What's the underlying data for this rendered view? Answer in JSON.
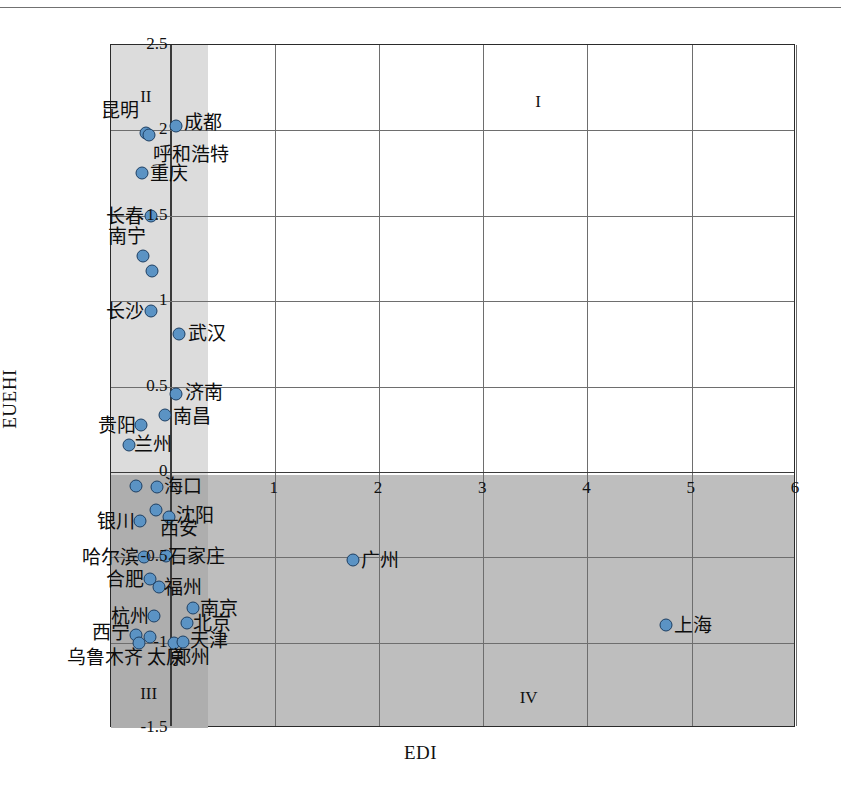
{
  "chart_data": {
    "type": "scatter",
    "title": "",
    "xlabel": "EDI",
    "ylabel": "EUEHI",
    "xlim": [
      -0.57,
      6
    ],
    "ylim": [
      -1.5,
      2.5
    ],
    "xticks": [
      "0",
      "1",
      "2",
      "3",
      "4",
      "5",
      "6"
    ],
    "xtick_values": [
      0,
      1,
      2,
      3,
      4,
      5,
      6
    ],
    "yticks": [
      "-1.5",
      "-1",
      "-0.5",
      "0",
      "0.5",
      "1",
      "1.5",
      "2",
      "2.5"
    ],
    "ytick_values": [
      -1.5,
      -1,
      -0.5,
      0,
      0.5,
      1,
      1.5,
      2,
      2.5
    ],
    "grid": true,
    "legend": "none",
    "quadrant_labels": [
      {
        "name": "I",
        "x": 3.5,
        "y": 2.22
      },
      {
        "name": "II",
        "x": -0.29,
        "y": 2.25
      },
      {
        "name": "III",
        "x": -0.29,
        "y": -1.25
      },
      {
        "name": "IV",
        "x": 3.35,
        "y": -1.27
      }
    ],
    "quadrant_divider_x": 0,
    "quadrant_divider_y": 0,
    "marker_color": "#5b93c4",
    "marker_edge_color": "#1d3f63",
    "points": [
      {
        "label": "昆明",
        "x": -0.235,
        "y": 1.985,
        "lp": "left",
        "lx": -0.3,
        "ly": 2.12
      },
      {
        "label": "呼和浩特",
        "x": -0.205,
        "y": 1.975,
        "lp": "right",
        "lx": -0.17,
        "ly": 1.86
      },
      {
        "label": "成都",
        "x": 0.055,
        "y": 2.025,
        "lp": "right",
        "lx": 0.13,
        "ly": 2.05
      },
      {
        "label": "重庆",
        "x": -0.275,
        "y": 1.75,
        "lp": "right",
        "lx": -0.2,
        "ly": 1.75
      },
      {
        "label": "长春",
        "x": -0.185,
        "y": 1.5,
        "lp": "left",
        "lx": -0.25,
        "ly": 1.5
      },
      {
        "label": "南宁",
        "x": -0.265,
        "y": 1.265,
        "lp": "left",
        "lx": -0.23,
        "ly": 1.38
      },
      {
        "label": "",
        "x": -0.175,
        "y": 1.175,
        "lp": "none",
        "lx": 0,
        "ly": 0
      },
      {
        "label": "长沙",
        "x": -0.185,
        "y": 0.945,
        "lp": "left",
        "lx": -0.25,
        "ly": 0.945
      },
      {
        "label": "武汉",
        "x": 0.085,
        "y": 0.805,
        "lp": "right",
        "lx": 0.17,
        "ly": 0.815
      },
      {
        "label": "济南",
        "x": 0.055,
        "y": 0.455,
        "lp": "right",
        "lx": 0.14,
        "ly": 0.465
      },
      {
        "label": "南昌",
        "x": -0.055,
        "y": 0.335,
        "lp": "right",
        "lx": 0.02,
        "ly": 0.325
      },
      {
        "label": "贵阳",
        "x": -0.285,
        "y": 0.275,
        "lp": "left",
        "lx": -0.33,
        "ly": 0.275
      },
      {
        "label": "兰州",
        "x": -0.395,
        "y": 0.155,
        "lp": "right",
        "lx": -0.35,
        "ly": 0.165
      },
      {
        "label": "海口",
        "x": -0.125,
        "y": -0.09,
        "lp": "right",
        "lx": -0.06,
        "ly": -0.085
      },
      {
        "label": "",
        "x": -0.335,
        "y": -0.085,
        "lp": "none",
        "lx": 0,
        "ly": 0
      },
      {
        "label": "沈阳",
        "x": -0.015,
        "y": -0.265,
        "lp": "right",
        "lx": 0.05,
        "ly": -0.255
      },
      {
        "label": "西安",
        "x": -0.135,
        "y": -0.225,
        "lp": "right",
        "lx": -0.1,
        "ly": -0.33
      },
      {
        "label": "银川",
        "x": -0.295,
        "y": -0.285,
        "lp": "left",
        "lx": -0.34,
        "ly": -0.285
      },
      {
        "label": "哈尔滨",
        "x": -0.255,
        "y": -0.5,
        "lp": "left",
        "lx": -0.3,
        "ly": -0.5
      },
      {
        "label": "石家庄",
        "x": -0.04,
        "y": -0.495,
        "lp": "right",
        "lx": -0.02,
        "ly": -0.49
      },
      {
        "label": "合肥",
        "x": -0.195,
        "y": -0.625,
        "lp": "left",
        "lx": -0.25,
        "ly": -0.625
      },
      {
        "label": "福州",
        "x": -0.105,
        "y": -0.675,
        "lp": "right",
        "lx": -0.06,
        "ly": -0.675
      },
      {
        "label": "杭州",
        "x": -0.155,
        "y": -0.845,
        "lp": "left",
        "lx": -0.21,
        "ly": -0.845
      },
      {
        "label": "西宁",
        "x": -0.335,
        "y": -0.955,
        "lp": "left",
        "lx": -0.385,
        "ly": -0.935
      },
      {
        "label": "乌鲁木齐",
        "x": -0.305,
        "y": -1.005,
        "lp": "left",
        "lx": -0.26,
        "ly": -1.085
      },
      {
        "label": "太原",
        "x": -0.195,
        "y": -0.965,
        "lp": "right",
        "lx": -0.22,
        "ly": -1.085
      },
      {
        "label": "郑州",
        "x": 0.035,
        "y": -1.0,
        "lp": "right",
        "lx": 0.015,
        "ly": -1.085
      },
      {
        "label": "天津",
        "x": 0.125,
        "y": -0.995,
        "lp": "right",
        "lx": 0.19,
        "ly": -0.985
      },
      {
        "label": "北京",
        "x": 0.155,
        "y": -0.885,
        "lp": "right",
        "lx": 0.22,
        "ly": -0.885
      },
      {
        "label": "南京",
        "x": 0.215,
        "y": -0.795,
        "lp": "right",
        "lx": 0.28,
        "ly": -0.795
      },
      {
        "label": "广州",
        "x": 1.755,
        "y": -0.515,
        "lp": "right",
        "lx": 1.83,
        "ly": -0.515
      },
      {
        "label": "上海",
        "x": 4.755,
        "y": -0.895,
        "lp": "right",
        "lx": 4.83,
        "ly": -0.895
      }
    ]
  }
}
